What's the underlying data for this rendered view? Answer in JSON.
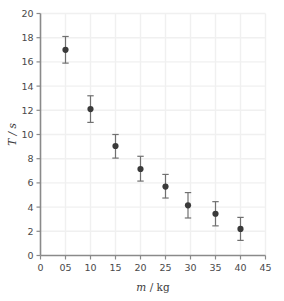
{
  "chart_data": {
    "type": "scatter",
    "title": "",
    "subtitle": "",
    "xlabel": "m / kg",
    "xlabel_variable": "m",
    "xlabel_unit": "kg",
    "ylabel": "T / s",
    "ylabel_variable": "T",
    "ylabel_unit": "s",
    "xlim": [
      0,
      45
    ],
    "ylim": [
      0,
      20
    ],
    "xticks": [
      0,
      5,
      10,
      15,
      20,
      25,
      30,
      35,
      40,
      45
    ],
    "xticklabels": [
      "0",
      "05",
      "10",
      "15",
      "20",
      "25",
      "30",
      "35",
      "40",
      "45"
    ],
    "yticks": [
      0,
      2,
      4,
      6,
      8,
      10,
      12,
      14,
      16,
      18,
      20
    ],
    "yticklabels": [
      "0",
      "2",
      "4",
      "6",
      "8",
      "10",
      "12",
      "14",
      "16",
      "18",
      "20"
    ],
    "grid": true,
    "legend": false,
    "legend_position": "none",
    "marker": "filled-circle",
    "marker_color": "#3a3a3a",
    "errorbar_color": "#707070",
    "grid_color": "#f0f0f0",
    "axis_color": "#8a8a8a",
    "x": [
      5,
      10,
      15,
      20,
      25,
      29.5,
      35,
      40
    ],
    "y": [
      17.0,
      12.1,
      9.05,
      7.15,
      5.7,
      4.15,
      3.45,
      2.2
    ],
    "yerr_low": [
      15.9,
      11.0,
      8.05,
      6.15,
      4.75,
      3.1,
      2.45,
      1.25
    ],
    "yerr_high": [
      18.1,
      13.2,
      10.0,
      8.2,
      6.7,
      5.2,
      4.45,
      3.15
    ],
    "points": [
      {
        "x": 5,
        "y": 17.0,
        "low": 15.9,
        "high": 18.1
      },
      {
        "x": 10,
        "y": 12.1,
        "low": 11.0,
        "high": 13.2
      },
      {
        "x": 15,
        "y": 9.05,
        "low": 8.05,
        "high": 10.0
      },
      {
        "x": 20,
        "y": 7.15,
        "low": 6.15,
        "high": 8.2
      },
      {
        "x": 25,
        "y": 5.7,
        "low": 4.75,
        "high": 6.7
      },
      {
        "x": 29.5,
        "y": 4.15,
        "low": 3.1,
        "high": 5.2
      },
      {
        "x": 35,
        "y": 3.45,
        "low": 2.45,
        "high": 4.45
      },
      {
        "x": 40,
        "y": 2.2,
        "low": 1.25,
        "high": 3.15
      }
    ]
  }
}
